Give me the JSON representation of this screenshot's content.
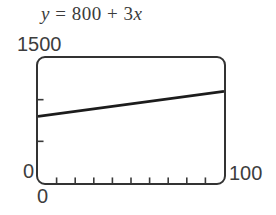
{
  "equation": {
    "lhs": "y",
    "equals": " = ",
    "intercept": "800",
    "plus": " + ",
    "slope": "3",
    "variable": "x"
  },
  "axis_labels": {
    "y_max": "1500",
    "y_min": "0",
    "x_min": "0",
    "x_max": "100"
  },
  "colors": {
    "ink": "#3d3d3d",
    "screen_border": "#333333",
    "tick": "#3a3a3a",
    "function_line": "#1c1c1c",
    "background": "#ffffff"
  },
  "chart_data": {
    "type": "line",
    "title": "y = 800 + 3x",
    "equation": "y = 800 + 3x",
    "frame": "graphing-calculator-screen",
    "xlabel": "",
    "ylabel": "",
    "xlim": [
      0,
      100
    ],
    "ylim": [
      0,
      1500
    ],
    "xscl": 10,
    "yscl": 500,
    "grid": false,
    "legend": false,
    "series": [
      {
        "name": "y = 800 + 3x",
        "slope": 3,
        "intercept": 800,
        "points": [
          [
            0,
            800
          ],
          [
            100,
            1100
          ]
        ]
      }
    ]
  }
}
